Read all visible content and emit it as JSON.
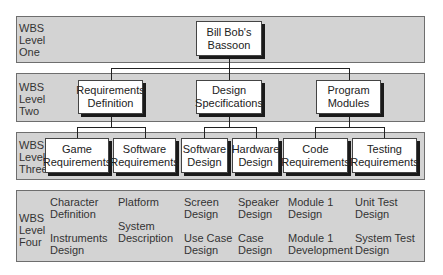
{
  "levels": [
    {
      "label_lines": [
        "WBS",
        "Level",
        "One"
      ]
    },
    {
      "label_lines": [
        "WBS",
        "Level",
        "Two"
      ]
    },
    {
      "label_lines": [
        "WBS",
        "Level",
        "Three"
      ]
    },
    {
      "label_lines": [
        "WBS",
        "Level",
        "Four"
      ]
    }
  ],
  "level_one": {
    "line1": "Bill Bob's",
    "line2": "Bassoon"
  },
  "level_two": [
    {
      "line1": "Requirements",
      "line2": "Definition"
    },
    {
      "line1": "Design",
      "line2": "Specifications"
    },
    {
      "line1": "Program",
      "line2": "Modules"
    }
  ],
  "level_three": [
    {
      "line1": "Game",
      "line2": "Requirements"
    },
    {
      "line1": "Software",
      "line2": "Requirements"
    },
    {
      "line1": "Software",
      "line2": "Design"
    },
    {
      "line1": "Hardware",
      "line2": "Design"
    },
    {
      "line1": "Code",
      "line2": "Requirements"
    },
    {
      "line1": "Testing",
      "line2": "Requirements"
    }
  ],
  "level_four": [
    {
      "top": {
        "line1": "Character",
        "line2": "Definition"
      },
      "bottom": {
        "line1": "Instruments",
        "line2": "Design"
      }
    },
    {
      "top": {
        "line1": "Platform",
        "line2": ""
      },
      "bottom": {
        "line1": "System",
        "line2": "Description"
      }
    },
    {
      "top": {
        "line1": "Screen",
        "line2": "Design"
      },
      "bottom": {
        "line1": "Use Case",
        "line2": "Design"
      }
    },
    {
      "top": {
        "line1": "Speaker",
        "line2": "Design"
      },
      "bottom": {
        "line1": "Case",
        "line2": "Design"
      }
    },
    {
      "top": {
        "line1": "Module 1",
        "line2": "Design"
      },
      "bottom": {
        "line1": "Module 1",
        "line2": "Development"
      }
    },
    {
      "top": {
        "line1": "Unit Test",
        "line2": "Design"
      },
      "bottom": {
        "line1": "System Test",
        "line2": "Design"
      }
    }
  ],
  "colors": {
    "band_fill": "#d3d3d3",
    "band_border": "#6e6e6e",
    "node_fill": "#ffffff",
    "shadow": "#1a1a1a"
  }
}
